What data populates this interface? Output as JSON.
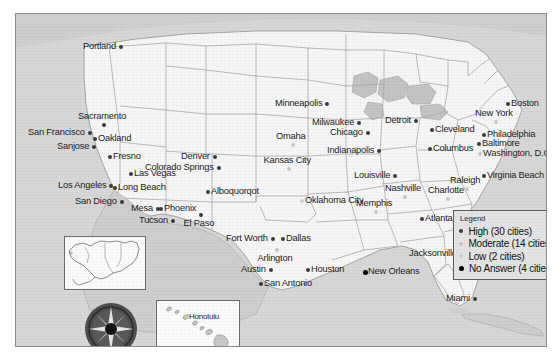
{
  "map": {
    "title": "United States city survey response map",
    "colors": {
      "ocean": "#d7d7d7",
      "land": "#f6f6f6",
      "border": "#8d8d8d",
      "state_line": "#9a9a9a",
      "high": "#3b3b3b",
      "moderate": "#c9c9c9",
      "low": "#cfcfcf",
      "no_answer": "#000000",
      "legend_bg": "#e3e3e3"
    }
  },
  "legend": {
    "title": "Legend",
    "items": [
      {
        "label": "High (30 cities)",
        "level": "high",
        "color": "#3b3b3b"
      },
      {
        "label": "Moderate (14 cities)",
        "level": "moderate",
        "color": "#c9c9c9"
      },
      {
        "label": "Low (2 cities)",
        "level": "low",
        "color": "#cfcfcf"
      },
      {
        "label": "No Answer (4 cities)",
        "level": "no_answer",
        "color": "#000000"
      }
    ]
  },
  "insets": {
    "alaska": {
      "name": "Alaska inset"
    },
    "hawaii": {
      "name": "Hawaii inset",
      "city": "Honolulu"
    },
    "compass": {
      "name": "Compass rose"
    }
  },
  "cities": [
    {
      "name": "Portland",
      "level": "high",
      "x": 103,
      "y": 31,
      "side": "left"
    },
    {
      "name": "San Francisco",
      "level": "high",
      "x": 72,
      "y": 117,
      "side": "left"
    },
    {
      "name": "Oakland",
      "level": "high",
      "x": 77,
      "y": 123,
      "side": "right"
    },
    {
      "name": "Sacramento",
      "level": "high",
      "x": 86,
      "y": 109,
      "side": "above"
    },
    {
      "name": "Sanjose",
      "level": "high",
      "x": 76,
      "y": 131,
      "side": "left"
    },
    {
      "name": "Fresno",
      "level": "high",
      "x": 92,
      "y": 141,
      "side": "right"
    },
    {
      "name": "Las Vegas",
      "level": "high",
      "x": 113,
      "y": 158,
      "side": "right"
    },
    {
      "name": "Los Angeles",
      "level": "high",
      "x": 93,
      "y": 170,
      "side": "left"
    },
    {
      "name": "Long Beach",
      "level": "high",
      "x": 97,
      "y": 172,
      "side": "right"
    },
    {
      "name": "San Diego",
      "level": "high",
      "x": 104,
      "y": 186,
      "side": "left"
    },
    {
      "name": "Mesa",
      "level": "high",
      "x": 140,
      "y": 193,
      "side": "left"
    },
    {
      "name": "Phoenix",
      "level": "high",
      "x": 143,
      "y": 193,
      "side": "right"
    },
    {
      "name": "Tucson",
      "level": "high",
      "x": 155,
      "y": 205,
      "side": "left"
    },
    {
      "name": "El Paso",
      "level": "high",
      "x": 183,
      "y": 199,
      "side": "below"
    },
    {
      "name": "Denver",
      "level": "high",
      "x": 197,
      "y": 141,
      "side": "left"
    },
    {
      "name": "Colorado Springs",
      "level": "high",
      "x": 201,
      "y": 152,
      "side": "left"
    },
    {
      "name": "Alboquorqot",
      "level": "high",
      "x": 190,
      "y": 176,
      "side": "right"
    },
    {
      "name": "Fort Worth",
      "level": "high",
      "x": 255,
      "y": 223,
      "side": "left"
    },
    {
      "name": "Dallas",
      "level": "high",
      "x": 265,
      "y": 223,
      "side": "right"
    },
    {
      "name": "Arlington",
      "level": "moderate",
      "x": 259,
      "y": 234,
      "side": "below"
    },
    {
      "name": "Austin",
      "level": "high",
      "x": 253,
      "y": 254,
      "side": "left"
    },
    {
      "name": "San Antonio",
      "level": "high",
      "x": 243,
      "y": 268,
      "side": "right"
    },
    {
      "name": "Houston",
      "level": "high",
      "x": 290,
      "y": 254,
      "side": "right"
    },
    {
      "name": "Oklahoma City",
      "level": "low",
      "x": 284,
      "y": 185,
      "side": "right"
    },
    {
      "name": "Kansas City",
      "level": "moderate",
      "x": 271,
      "y": 153,
      "side": "above"
    },
    {
      "name": "Omaha",
      "level": "moderate",
      "x": 275,
      "y": 129,
      "side": "above"
    },
    {
      "name": "Minneapolis",
      "level": "high",
      "x": 309,
      "y": 88,
      "side": "left"
    },
    {
      "name": "Milwaukee",
      "level": "high",
      "x": 341,
      "y": 107,
      "side": "left"
    },
    {
      "name": "Chicago",
      "level": "high",
      "x": 350,
      "y": 117,
      "side": "left"
    },
    {
      "name": "Detroit",
      "level": "high",
      "x": 398,
      "y": 105,
      "side": "left"
    },
    {
      "name": "Cleveland",
      "level": "high",
      "x": 414,
      "y": 114,
      "side": "right"
    },
    {
      "name": "Columbus",
      "level": "high",
      "x": 412,
      "y": 133,
      "side": "right"
    },
    {
      "name": "Indianapolis",
      "level": "high",
      "x": 361,
      "y": 135,
      "side": "left"
    },
    {
      "name": "Louisville",
      "level": "high",
      "x": 377,
      "y": 160,
      "side": "left"
    },
    {
      "name": "Boston",
      "level": "high",
      "x": 490,
      "y": 88,
      "side": "right"
    },
    {
      "name": "New York",
      "level": "moderate",
      "x": 478,
      "y": 106,
      "side": "above"
    },
    {
      "name": "Philadelphia",
      "level": "high",
      "x": 466,
      "y": 119,
      "side": "right"
    },
    {
      "name": "Baltimore",
      "level": "high",
      "x": 461,
      "y": 128,
      "side": "right"
    },
    {
      "name": "Washington, D.C.",
      "level": "moderate",
      "x": 462,
      "y": 138,
      "side": "right"
    },
    {
      "name": "Virginia Beach",
      "level": "high",
      "x": 466,
      "y": 160,
      "side": "right"
    },
    {
      "name": "Raleigh",
      "level": "moderate",
      "x": 449,
      "y": 173,
      "side": "above"
    },
    {
      "name": "Charlotte",
      "level": "moderate",
      "x": 430,
      "y": 183,
      "side": "above"
    },
    {
      "name": "Nashville",
      "level": "moderate",
      "x": 387,
      "y": 181,
      "side": "above"
    },
    {
      "name": "Memphis",
      "level": "moderate",
      "x": 358,
      "y": 196,
      "side": "above"
    },
    {
      "name": "Atlanta",
      "level": "high",
      "x": 404,
      "y": 203,
      "side": "right"
    },
    {
      "name": "Jacksonville",
      "level": "high",
      "x": 444,
      "y": 238,
      "side": "left"
    },
    {
      "name": "New Orleans",
      "level": "no_answer",
      "x": 347,
      "y": 256,
      "side": "right"
    },
    {
      "name": "Miami",
      "level": "high",
      "x": 457,
      "y": 283,
      "side": "left"
    },
    {
      "name": "Honolulu",
      "level": "moderate",
      "x": 0,
      "y": 0,
      "side": "inset"
    }
  ]
}
